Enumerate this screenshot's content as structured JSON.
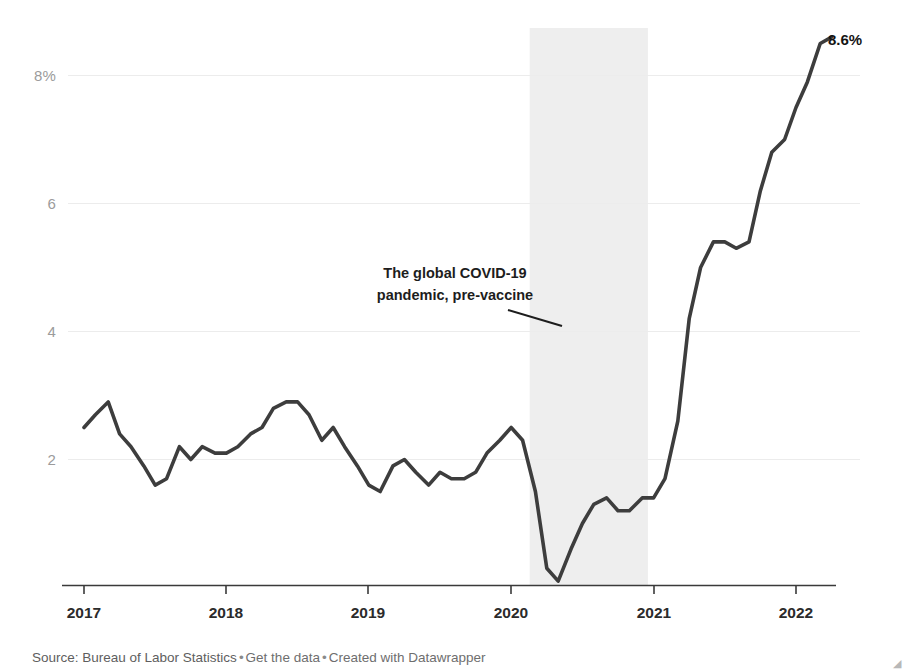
{
  "chart_data": {
    "type": "line",
    "title": "",
    "subtitle": "",
    "xlabel": "",
    "ylabel": "",
    "xlim": [
      2017.0,
      2022.28
    ],
    "ylim": [
      0,
      8.9
    ],
    "grid": true,
    "legend_position": "none",
    "y_ticks": [
      "8%",
      "6",
      "4",
      "2"
    ],
    "y_tick_values": [
      8,
      6,
      4,
      2
    ],
    "x_ticks": [
      "2017",
      "2018",
      "2019",
      "2020",
      "2021",
      "2022"
    ],
    "x_tick_values": [
      2017,
      2018,
      2019,
      2020,
      2021,
      2022
    ],
    "series": [
      {
        "name": "CPI inflation rate",
        "color": "#3d3d3d",
        "x": [
          2017.0,
          2017.08,
          2017.17,
          2017.25,
          2017.33,
          2017.42,
          2017.5,
          2017.58,
          2017.67,
          2017.75,
          2017.83,
          2017.92,
          2018.0,
          2018.08,
          2018.17,
          2018.25,
          2018.33,
          2018.42,
          2018.5,
          2018.58,
          2018.67,
          2018.75,
          2018.83,
          2018.92,
          2019.0,
          2019.08,
          2019.17,
          2019.25,
          2019.33,
          2019.42,
          2019.5,
          2019.58,
          2019.67,
          2019.75,
          2019.83,
          2019.92,
          2020.0,
          2020.08,
          2020.17,
          2020.25,
          2020.33,
          2020.42,
          2020.5,
          2020.58,
          2020.67,
          2020.75,
          2020.83,
          2020.92,
          2021.0,
          2021.08,
          2021.17,
          2021.25,
          2021.33,
          2021.42,
          2021.5,
          2021.58,
          2021.67,
          2021.75,
          2021.83,
          2021.92,
          2022.0,
          2022.08,
          2022.17,
          2022.25
        ],
        "values": [
          2.5,
          2.7,
          2.9,
          2.4,
          2.2,
          1.9,
          1.6,
          1.7,
          2.2,
          2.0,
          2.2,
          2.1,
          2.1,
          2.2,
          2.4,
          2.5,
          2.8,
          2.9,
          2.9,
          2.7,
          2.3,
          2.5,
          2.2,
          1.9,
          1.6,
          1.5,
          1.9,
          2.0,
          1.8,
          1.6,
          1.8,
          1.7,
          1.7,
          1.8,
          2.1,
          2.3,
          2.5,
          2.3,
          1.5,
          0.3,
          0.1,
          0.6,
          1.0,
          1.3,
          1.4,
          1.2,
          1.2,
          1.4,
          1.4,
          1.7,
          2.6,
          4.2,
          5.0,
          5.4,
          5.4,
          5.3,
          5.4,
          6.2,
          6.8,
          7.0,
          7.5,
          7.9,
          8.5,
          8.6
        ]
      }
    ],
    "highlight_band": {
      "label": "pandemic-pre-vaccine-band",
      "start": 2020.13,
      "end": 2020.96,
      "color": "#eeeeee"
    },
    "annotations": [
      {
        "name": "pandemic-annotation",
        "line1": "The global COVID-19",
        "line2": "pandemic, pre-vaccine",
        "leader_line": true
      }
    ],
    "end_value_label": "8.6%"
  },
  "footer": {
    "source_prefix": "Source: Bureau of Labor Statistics",
    "separator": "•",
    "get_data_label": "Get the data",
    "credit_label": "Created with Datawrapper"
  },
  "colors": {
    "line": "#3d3d3d",
    "grid": "#ececec",
    "axis": "#3a3a3a",
    "band": "#eeeeee",
    "ytick_text": "#9b9b9b",
    "xtick_text": "#2b2b2b",
    "footer_text": "#5e5e5e"
  }
}
